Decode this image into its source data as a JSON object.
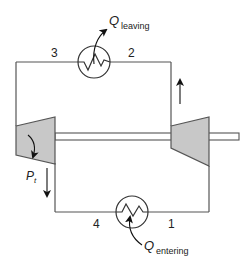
{
  "diagram": {
    "state_points": {
      "p1": "1",
      "p2": "2",
      "p3": "3",
      "p4": "4"
    },
    "heat_leaving": {
      "symbol": "Q",
      "subscript": "leaving"
    },
    "heat_entering": {
      "symbol": "Q",
      "subscript": "entering"
    },
    "turbine_power": {
      "symbol": "P",
      "subscript": "t"
    },
    "components": [
      "turbine",
      "compressor",
      "heat-rejection-exchanger",
      "heat-addition-exchanger",
      "shaft"
    ],
    "colors": {
      "line": "#555555",
      "fill": "#c8c8c8"
    }
  }
}
